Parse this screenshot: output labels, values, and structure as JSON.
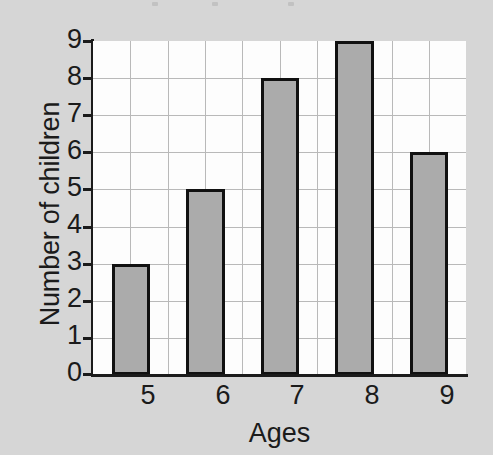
{
  "chart_data": {
    "type": "bar",
    "title": "",
    "xlabel": "Ages",
    "ylabel": "Number of children",
    "categories": [
      "5",
      "6",
      "7",
      "8",
      "9"
    ],
    "values": [
      3,
      5,
      8,
      9,
      6
    ],
    "ylim": [
      0,
      9
    ],
    "ytick_labels": [
      "0",
      "1",
      "2",
      "3",
      "4",
      "5",
      "6",
      "7",
      "8",
      "9"
    ],
    "ytick_values": [
      0,
      1,
      2,
      3,
      4,
      5,
      6,
      7,
      8,
      9
    ],
    "xtick_labels": [
      "5",
      "6",
      "7",
      "8",
      "9"
    ],
    "grid": true,
    "legend": null,
    "legend_position": "none",
    "bar_fill_color": "#ababab",
    "bar_border_color": "#111111",
    "plot_background_color": "#fdfdfd",
    "page_background_color": "#d6d6d6",
    "grid_line_color": "#b9b9b9",
    "axis_color": "#1b1b1b",
    "text_color": "#1b1b1b"
  }
}
